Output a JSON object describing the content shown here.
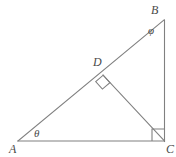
{
  "figure": {
    "type": "geometry-diagram",
    "background_color": "#ffffff",
    "stroke_color": "#808080",
    "label_color": "#4a4a4a",
    "stroke_width": 1,
    "width": 176,
    "height": 157
  },
  "vertices": [
    {
      "id": "A",
      "label": "A",
      "x": 18,
      "y": 141
    },
    {
      "id": "B",
      "label": "B",
      "x": 164,
      "y": 20
    },
    {
      "id": "C",
      "label": "C",
      "x": 164,
      "y": 141
    },
    {
      "id": "D",
      "label": "D",
      "x": 103,
      "y": 75
    }
  ],
  "segments": [
    {
      "id": "AC",
      "name": "base-segment-ac",
      "from": "A",
      "to": "C"
    },
    {
      "id": "AB",
      "name": "hypotenuse-segment-ab",
      "from": "A",
      "to": "B"
    },
    {
      "id": "BC",
      "name": "vertical-segment-bc",
      "from": "B",
      "to": "C"
    },
    {
      "id": "DC",
      "name": "altitude-segment-dc",
      "from": "D",
      "to": "C"
    }
  ],
  "angles": [
    {
      "id": "theta",
      "label": "θ",
      "at_vertex": "A",
      "label_x": 38,
      "label_y": 134,
      "type": "named"
    },
    {
      "id": "phi",
      "label": "φ",
      "at_vertex": "B",
      "label_x": 152,
      "label_y": 31,
      "type": "named"
    },
    {
      "id": "right-angle-c",
      "label": "",
      "at_vertex": "C",
      "type": "right-angle-marker"
    },
    {
      "id": "right-angle-d",
      "label": "",
      "at_vertex": "D",
      "type": "right-angle-marker"
    }
  ],
  "right_angle_markers": [
    {
      "id": "marker-c",
      "at_vertex": "C",
      "orientation": "axis-aligned",
      "size": 12,
      "points": "152,141 152,129 164,129 164,141"
    },
    {
      "id": "marker-d",
      "at_vertex": "D",
      "orientation": "rotated",
      "size": 11,
      "points": "95.4,81.7 103,75 109.7,82.6 102.1,89.3"
    }
  ]
}
